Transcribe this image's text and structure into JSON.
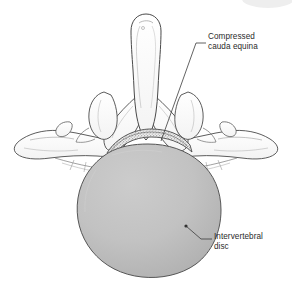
{
  "figure": {
    "background_color": "#ffffff",
    "outline_color": "#4a4a4a",
    "disc_fill_color": "#bcbcbc",
    "disc_edge_color": "#555555",
    "stipple_color": "#6f6f6f",
    "leader_line_color": "#3b3b3b",
    "text_color": "#2b2b2b"
  },
  "labels": [
    {
      "id": "compressed-cauda-equina",
      "text": "Compressed\ncauda equina",
      "line1": "Compressed",
      "line2": "cauda equina",
      "x": 208,
      "y": 32,
      "leader": {
        "from_x": 206,
        "from_y": 43,
        "elbow_x": 196,
        "elbow_y": 43,
        "to_x": 161,
        "to_y": 141
      }
    },
    {
      "id": "intervertebral-disc",
      "text": "Intervertebral\ndisc",
      "line1": "Intervertebral",
      "line2": "disc",
      "x": 214,
      "y": 232,
      "leader": {
        "from_x": 212,
        "from_y": 239,
        "elbow_x": 201,
        "elbow_y": 239,
        "to_x": 186,
        "to_y": 226,
        "dot_x": 186,
        "dot_y": 226,
        "dot_r": 1.6
      }
    }
  ],
  "structures": [
    {
      "id": "spinous-process",
      "name": "Spinous process"
    },
    {
      "id": "lamina-left",
      "name": "Left lamina"
    },
    {
      "id": "lamina-right",
      "name": "Right lamina"
    },
    {
      "id": "superior-articular-process-left",
      "name": "Left superior articular process"
    },
    {
      "id": "superior-articular-process-right",
      "name": "Right superior articular process"
    },
    {
      "id": "transverse-process-left",
      "name": "Left transverse process"
    },
    {
      "id": "transverse-process-right",
      "name": "Right transverse process"
    },
    {
      "id": "compressed-cauda-equina-band",
      "name": "Compressed cauda equina"
    },
    {
      "id": "intervertebral-disc-body",
      "name": "Intervertebral disc"
    }
  ],
  "artifacts": {
    "corner_arc": {
      "id": "top-right-arc",
      "color": "#e9e9e9",
      "cx": 268,
      "cy": 0,
      "rx": 26,
      "ry": 9
    }
  }
}
